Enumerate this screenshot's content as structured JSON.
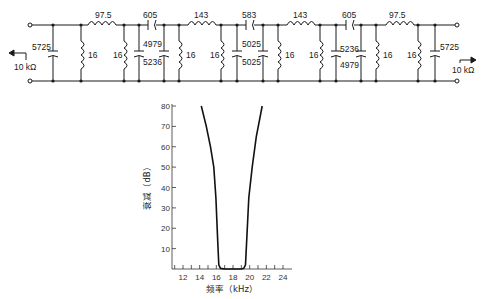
{
  "circuit": {
    "source_impedance": "10 kΩ",
    "load_impedance": "10 kΩ",
    "series_labels": [
      "97.5",
      "605",
      "143",
      "583",
      "143",
      "605",
      "97.5"
    ],
    "shunt_cap_left": "5725",
    "shunt_cap_right": "5725",
    "shunt_inductors": [
      "16",
      "16",
      "16",
      "16",
      "16",
      "16",
      "16",
      "16",
      "16",
      "16"
    ],
    "cap_pairs": [
      {
        "top": "4979",
        "bottom": "5236"
      },
      {
        "top": "5025",
        "bottom": "5025"
      },
      {
        "top": "5236",
        "bottom": "4979"
      }
    ]
  },
  "chart_data": {
    "type": "line",
    "title": "",
    "xlabel": "频率（kHz）",
    "ylabel": "衰减（dB）",
    "x_ticks": [
      "12",
      "14",
      "16",
      "18",
      "20",
      "22",
      "24"
    ],
    "y_ticks": [
      "10",
      "20",
      "30",
      "40",
      "50",
      "60",
      "70",
      "80"
    ],
    "xlim": [
      11,
      24.5
    ],
    "ylim": [
      0,
      80
    ],
    "grid": false,
    "series": [
      {
        "name": "Attenuation",
        "x": [
          14.2,
          14.8,
          15.3,
          15.7,
          15.95,
          16.15,
          16.3,
          16.5,
          17.0,
          18.0,
          19.0,
          19.3,
          19.5,
          19.65,
          19.9,
          20.3,
          20.8,
          21.5
        ],
        "y": [
          80,
          70,
          60,
          50,
          35,
          15,
          2,
          0.3,
          0,
          0,
          0,
          0.3,
          2,
          15,
          35,
          50,
          65,
          80
        ]
      }
    ]
  }
}
